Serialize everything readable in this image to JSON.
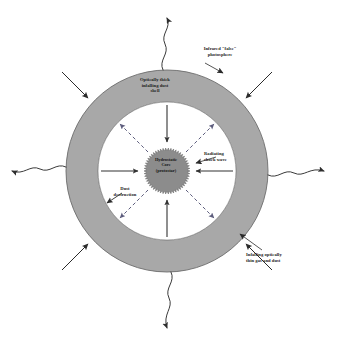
{
  "figure": {
    "background_color": "#ffffff"
  },
  "colors": {
    "shell_fill": "#a8a8a8",
    "shell_stroke": "#6f6f6f",
    "cavity_fill": "#ffffff",
    "core_fill": "#8c8c8c",
    "core_stroke": "#5e5e5e",
    "arrow_solid": "#333333",
    "arrow_dashed": "#6a6a8a",
    "photon_line": "#3a3a3a",
    "text": "#1d1d1d"
  },
  "labels": {
    "dust_shell": "Optically thick\ninfalling dust\nshell",
    "photosphere": "Infrared \"false\"\nphotosphere",
    "shock_wave": "Radiating\nshock wave",
    "dust_destruction": "Dust\ndestruction",
    "infalling_gas": "Infalling optically\nthin gas and dust",
    "core": "Hydrostatic\nCore\n(protostar)"
  },
  "chart_data": {
    "type": "diagram",
    "center": {
      "x": 167,
      "y": 171
    },
    "regions": [
      {
        "name": "hydrostatic-core",
        "shape": "spiky-circle",
        "radius": 23,
        "fill": "#8c8c8c",
        "label": "Hydrostatic Core (protostar)"
      },
      {
        "name": "optically-thin-cavity",
        "shape": "annulus",
        "inner_radius": 23,
        "outer_radius": 69,
        "fill": "#ffffff",
        "label": "Infalling optically thin gas and dust"
      },
      {
        "name": "optically-thick-dust-shell",
        "shape": "annulus",
        "inner_radius": 69,
        "outer_radius": 101,
        "fill": "#a8a8a8",
        "label": "Optically thick infalling dust shell"
      }
    ],
    "infall_arrows_inward": [
      {
        "name": "infall-arrow-north",
        "angle_deg": 90,
        "from_r": 66,
        "to_r": 27,
        "style": "solid"
      },
      {
        "name": "infall-arrow-south",
        "angle_deg": 270,
        "from_r": 66,
        "to_r": 27,
        "style": "solid"
      },
      {
        "name": "infall-arrow-east",
        "angle_deg": 0,
        "from_r": 66,
        "to_r": 27,
        "style": "solid"
      },
      {
        "name": "infall-arrow-west",
        "angle_deg": 180,
        "from_r": 66,
        "to_r": 27,
        "style": "solid"
      }
    ],
    "shock_arrows_outward": [
      {
        "name": "shock-arrow-ne",
        "angle_deg": 45,
        "from_r": 27,
        "to_r": 66,
        "style": "dashed"
      },
      {
        "name": "shock-arrow-nw",
        "angle_deg": 135,
        "from_r": 27,
        "to_r": 66,
        "style": "dashed"
      },
      {
        "name": "shock-arrow-sw",
        "angle_deg": 225,
        "from_r": 27,
        "to_r": 66,
        "style": "dashed"
      },
      {
        "name": "shock-arrow-se",
        "angle_deg": 315,
        "from_r": 27,
        "to_r": 66,
        "style": "dashed"
      }
    ],
    "external_infall_arrows": [
      {
        "name": "external-arrow-nw",
        "angle_deg": 135
      },
      {
        "name": "external-arrow-ne",
        "angle_deg": 45
      },
      {
        "name": "external-arrow-sw",
        "angle_deg": 225
      },
      {
        "name": "external-arrow-se",
        "angle_deg": 315
      }
    ],
    "photon_waves": [
      {
        "name": "photon-wave-north",
        "angle_deg": 90
      },
      {
        "name": "photon-wave-south",
        "angle_deg": 270
      },
      {
        "name": "photon-wave-east",
        "angle_deg": 0
      },
      {
        "name": "photon-wave-west",
        "angle_deg": 180
      }
    ],
    "annotations": [
      {
        "name": "label-dust-shell",
        "text": "Optically thick infalling dust shell",
        "target": "optically-thick-dust-shell"
      },
      {
        "name": "label-photosphere",
        "text": "Infrared \"false\" photosphere",
        "target": "shell-outer-edge"
      },
      {
        "name": "label-shock-wave",
        "text": "Radiating shock wave",
        "target": "core-boundary"
      },
      {
        "name": "label-dust-destruction",
        "text": "Dust destruction",
        "target": "dust-destruction-front"
      },
      {
        "name": "label-infalling-gas",
        "text": "Infalling optically thin gas and dust",
        "target": "shell-outer-edge"
      }
    ]
  }
}
